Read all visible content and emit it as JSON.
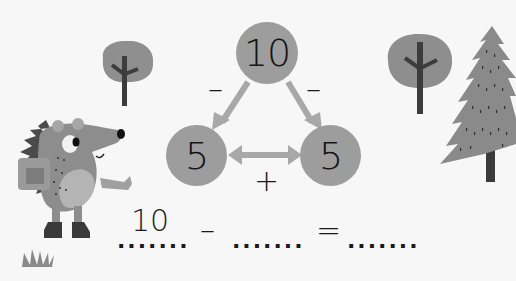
{
  "diagram": {
    "top_number": "10",
    "left_number": "5",
    "right_number": "5",
    "left_operator": "–",
    "right_operator": "–",
    "bottom_operator": "+"
  },
  "equation": {
    "first_value": "10",
    "minus_sign": "–",
    "equals_sign": "=",
    "blank_1": ".......",
    "blank_2": ".......",
    "blank_3": "......."
  },
  "colors": {
    "background": "#f7f7f7",
    "circle": "#9d9d9d",
    "arrow": "#a8a8a8",
    "text": "#1a1a1a"
  }
}
